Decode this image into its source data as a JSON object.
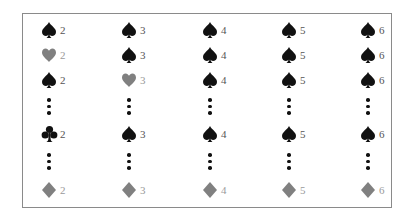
{
  "colors": {
    "black_suit": "#111111",
    "gray_suit": "#808080",
    "border": "#8a8a8a"
  },
  "columns": [
    "2",
    "3",
    "4",
    "5",
    "6"
  ],
  "rows": [
    {
      "type": "cards",
      "cells": [
        {
          "suit": "spade",
          "rank": "2"
        },
        {
          "suit": "spade",
          "rank": "3"
        },
        {
          "suit": "spade",
          "rank": "4"
        },
        {
          "suit": "spade",
          "rank": "5"
        },
        {
          "suit": "spade",
          "rank": "6"
        }
      ]
    },
    {
      "type": "cards",
      "cells": [
        {
          "suit": "heart",
          "rank": "2"
        },
        {
          "suit": "spade",
          "rank": "3"
        },
        {
          "suit": "spade",
          "rank": "4"
        },
        {
          "suit": "spade",
          "rank": "5"
        },
        {
          "suit": "spade",
          "rank": "6"
        }
      ]
    },
    {
      "type": "cards",
      "cells": [
        {
          "suit": "spade",
          "rank": "2"
        },
        {
          "suit": "heart",
          "rank": "3"
        },
        {
          "suit": "spade",
          "rank": "4"
        },
        {
          "suit": "spade",
          "rank": "5"
        },
        {
          "suit": "spade",
          "rank": "6"
        }
      ]
    },
    {
      "type": "ellipsis"
    },
    {
      "type": "cards",
      "cells": [
        {
          "suit": "club",
          "rank": "2"
        },
        {
          "suit": "spade",
          "rank": "3"
        },
        {
          "suit": "spade",
          "rank": "4"
        },
        {
          "suit": "spade",
          "rank": "5"
        },
        {
          "suit": "spade",
          "rank": "6"
        }
      ]
    },
    {
      "type": "ellipsis"
    },
    {
      "type": "cards",
      "cells": [
        {
          "suit": "diamond",
          "rank": "2"
        },
        {
          "suit": "diamond",
          "rank": "3"
        },
        {
          "suit": "diamond",
          "rank": "4"
        },
        {
          "suit": "diamond",
          "rank": "5"
        },
        {
          "suit": "diamond",
          "rank": "6"
        }
      ]
    }
  ]
}
